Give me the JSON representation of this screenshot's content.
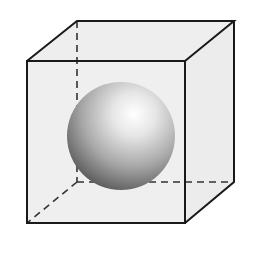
{
  "diagram": {
    "colors": {
      "background": "#ffffff",
      "face_fill": "#eeeeee",
      "edge": "#1a1a1a",
      "sphere_highlight": "#ffffff",
      "sphere_mid": "#b0b0b0",
      "sphere_shadow": "#4a4a4a"
    },
    "cube": {
      "front": {
        "tl": [
          27,
          61
        ],
        "tr": [
          185,
          61
        ],
        "br": [
          185,
          223
        ],
        "bl": [
          27,
          223
        ]
      },
      "back": {
        "tl": [
          77,
          21
        ],
        "tr": [
          234,
          21
        ],
        "br": [
          234,
          182
        ],
        "bl": [
          77,
          182
        ]
      },
      "hidden_edges_style": "dashed"
    },
    "sphere": {
      "cx": 121,
      "cy": 136,
      "r": 54
    }
  }
}
